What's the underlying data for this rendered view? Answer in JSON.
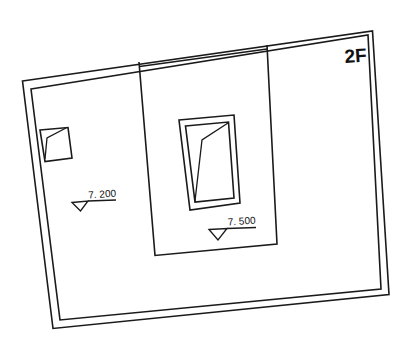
{
  "drawing": {
    "floor_label": "2F",
    "elevations": [
      {
        "id": "left-room",
        "value": "7. 200"
      },
      {
        "id": "center-room",
        "value": "7. 500"
      }
    ],
    "colors": {
      "line": "#1a1a1a",
      "background": "#ffffff"
    }
  }
}
